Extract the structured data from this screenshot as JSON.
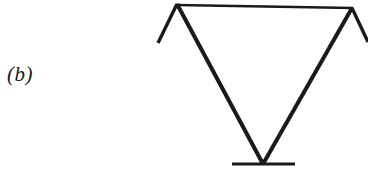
{
  "figure": {
    "panel_label": "(b)",
    "caption_text": "",
    "background_color": "#ffffff",
    "ink_color": "#1a1a1a"
  },
  "chart_data": {
    "type": "diagram",
    "title": "",
    "subtitle": "",
    "xlabel": "",
    "ylabel": "",
    "canvas": {
      "width": 368,
      "height": 190
    },
    "strokes": [
      {
        "name": "top-horizontal-bar",
        "kind": "line",
        "x1": 176,
        "y1": 5,
        "x2": 353,
        "y2": 8,
        "width": 2.6,
        "color": "#1a1a1a"
      },
      {
        "name": "left-diagonal",
        "kind": "line",
        "x1": 177,
        "y1": 4,
        "x2": 263,
        "y2": 164,
        "width": 4.0,
        "color": "#1a1a1a"
      },
      {
        "name": "right-diagonal",
        "kind": "line",
        "x1": 352,
        "y1": 8,
        "x2": 263,
        "y2": 164,
        "width": 4.0,
        "color": "#1a1a1a"
      },
      {
        "name": "left-upper-stub",
        "kind": "line",
        "x1": 177,
        "y1": 4,
        "x2": 158,
        "y2": 43,
        "width": 3.4,
        "color": "#1a1a1a"
      },
      {
        "name": "right-upper-stub",
        "kind": "line",
        "x1": 352,
        "y1": 8,
        "x2": 368,
        "y2": 42,
        "width": 3.4,
        "color": "#1a1a1a"
      },
      {
        "name": "bottom-horizontal-bar",
        "kind": "line",
        "x1": 232,
        "y1": 164,
        "x2": 295,
        "y2": 164,
        "width": 3.2,
        "color": "#1a1a1a"
      }
    ],
    "vertices": [
      {
        "name": "top-left-vertex",
        "x": 177,
        "y": 4
      },
      {
        "name": "top-right-vertex",
        "x": 352,
        "y": 8
      },
      {
        "name": "bottom-apex-vertex",
        "x": 263,
        "y": 164
      }
    ],
    "labels": [
      {
        "name": "panel-label",
        "text": "(b)",
        "x": 7,
        "y": 64
      }
    ],
    "grid": false,
    "legend": false
  }
}
